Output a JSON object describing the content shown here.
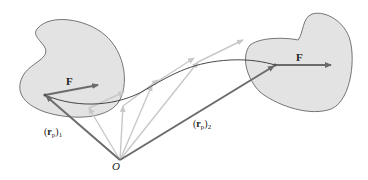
{
  "diagram": {
    "type": "rigid-body translation vector diagram",
    "origin_label": "O",
    "force_label": "F",
    "position_vectors": [
      {
        "name": "r_p",
        "label_main": "r",
        "label_sub": "p",
        "index": "1"
      },
      {
        "name": "r_p",
        "label_main": "r",
        "label_sub": "p",
        "index": "2"
      }
    ],
    "colors": {
      "body_fill": "#e3e3e3",
      "body_stroke": "#555555",
      "dark_vector": "#6b6b6b",
      "light_vector": "#c8c8c8",
      "path_curve": "#333333"
    }
  }
}
